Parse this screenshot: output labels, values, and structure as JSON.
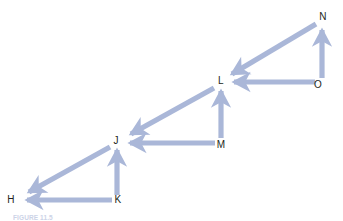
{
  "figure": {
    "caption": "FIGURE 11.5",
    "arrow_color": "#aab7d8",
    "label_color": "#231f20",
    "background_color": "#ffffff"
  },
  "nodes": [
    {
      "id": "H",
      "label": "H",
      "x": 11,
      "y": 200
    },
    {
      "id": "K",
      "label": "K",
      "x": 118,
      "y": 200
    },
    {
      "id": "J",
      "label": "J",
      "x": 116,
      "y": 141
    },
    {
      "id": "M",
      "label": "M",
      "x": 221,
      "y": 145
    },
    {
      "id": "L",
      "label": "L",
      "x": 221,
      "y": 81
    },
    {
      "id": "O",
      "label": "O",
      "x": 318,
      "y": 85
    },
    {
      "id": "N",
      "label": "N",
      "x": 323,
      "y": 17
    }
  ],
  "edges": [
    {
      "from": "K",
      "to": "H",
      "direction": "left",
      "kind": "horizontal"
    },
    {
      "from": "K",
      "to": "J",
      "direction": "up",
      "kind": "vertical"
    },
    {
      "from": "J",
      "to": "H",
      "direction": "down-left",
      "kind": "diagonal"
    },
    {
      "from": "M",
      "to": "J",
      "direction": "left",
      "kind": "horizontal"
    },
    {
      "from": "M",
      "to": "L",
      "direction": "up",
      "kind": "vertical"
    },
    {
      "from": "L",
      "to": "J",
      "direction": "down-left",
      "kind": "diagonal"
    },
    {
      "from": "N",
      "to": "L",
      "direction": "down-left",
      "kind": "diagonal"
    },
    {
      "from": "O",
      "to": "L",
      "direction": "left",
      "kind": "horizontal"
    },
    {
      "from": "O",
      "to": "N",
      "direction": "up",
      "kind": "vertical"
    }
  ]
}
